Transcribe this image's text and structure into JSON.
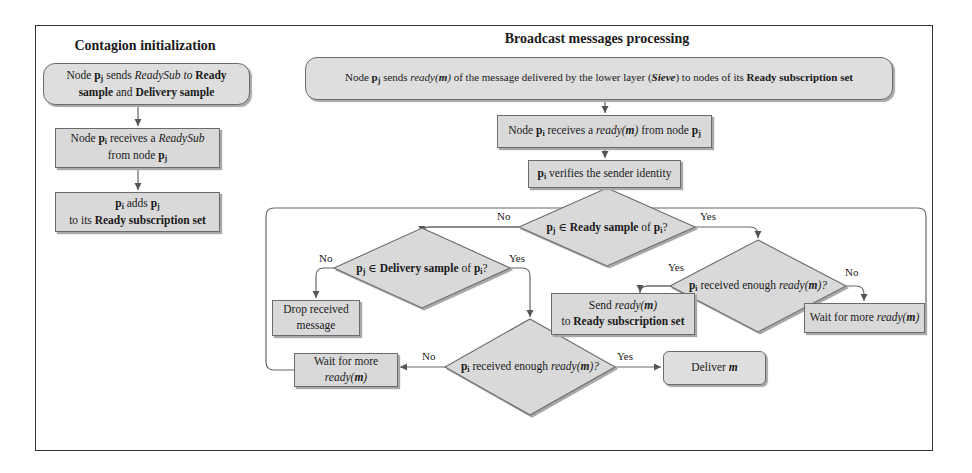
{
  "sections": {
    "left_title": "Contagion initialization",
    "right_title": "Broadcast messages processing"
  },
  "left_flow": {
    "box1": {
      "pre": "Node ",
      "pj": "p",
      "pj_sub": "j",
      "mid1": " sends ",
      "readysub": "ReadySub",
      "to": " to ",
      "ready": "Ready",
      "line2_bold1": "sample",
      "and": " and ",
      "line2_bold2": "Delivery sample"
    },
    "box2": {
      "pre": "Node ",
      "pi": "p",
      "pi_sub": "i",
      "mid": " receives a ",
      "readysub": "ReadySub",
      "line2": "from node ",
      "pj": "p",
      "pj_sub": "j"
    },
    "box3": {
      "pi": "p",
      "pi_sub": "i",
      "mid": " adds ",
      "pj": "p",
      "pj_sub": "j",
      "line2_pre": "to its ",
      "line2_bold": "Ready subscription set"
    }
  },
  "broadcast_flow": {
    "top_box": {
      "pre": "Node ",
      "pj": "p",
      "pj_sub": "j",
      "mid1": " sends ",
      "ready_fn": "ready(",
      "m": "m",
      "close": ")",
      "mid2": " of the message delivered by the lower layer (",
      "sieve": "Sieve",
      "mid3": ") to nodes of its ",
      "bold_end": "Ready subscription set"
    },
    "receive_box": {
      "pre": "Node ",
      "pi": "p",
      "pi_sub": "i",
      "mid": " receives a ",
      "ready_fn": "ready(",
      "m": "m",
      "close": ")",
      "post": " from node ",
      "pj": "p",
      "pj_sub": "j"
    },
    "verify_box": {
      "pi": "p",
      "pi_sub": "i",
      "text": " verifies the sender identity"
    },
    "decision_ready_sample": {
      "pj": "p",
      "pj_sub": "j",
      "elem": " ∈ ",
      "bold": "Ready sample",
      "of": " of  ",
      "pi": "p",
      "pi_sub": "i",
      "q": "?",
      "no": "No",
      "yes": "Yes"
    },
    "decision_delivery_sample": {
      "pj": "p",
      "pj_sub": "j",
      "elem": " ∈ ",
      "bold": "Delivery sample",
      "of": " of  ",
      "pi": "p",
      "pi_sub": "i",
      "q": "?",
      "no": "No",
      "yes": "Yes"
    },
    "decision_enough_right": {
      "pi": "p",
      "pi_sub": "i",
      "text": " received enough ",
      "ready_fn": "ready(",
      "m": "m",
      "close": ")?",
      "yes": "Yes",
      "no": "No"
    },
    "decision_enough_bottom": {
      "pi": "p",
      "pi_sub": "i",
      "text": " received enough ",
      "ready_fn": "ready(",
      "m": "m",
      "close": ")?",
      "no": "No",
      "yes": "Yes"
    },
    "drop_box": {
      "line1": "Drop received",
      "line2": "message"
    },
    "send_box": {
      "line1_pre": "Send ",
      "ready_fn": "ready(",
      "m": "m",
      "close": ")",
      "line2_pre": "to ",
      "line2_bold": "Ready subscription set"
    },
    "wait_right_box": {
      "pre": "Wait for more ",
      "ready_fn": "ready(",
      "m": "m",
      "close": ")"
    },
    "wait_left_box": {
      "line1": "Wait for more",
      "ready_fn": "ready(",
      "m": "m",
      "close": ")"
    },
    "deliver_box": {
      "pre": "Deliver ",
      "m": "m"
    }
  },
  "colors": {
    "box_fill": "#d9d9d9",
    "stroke": "#6b6b6b",
    "frame": "#333333"
  }
}
